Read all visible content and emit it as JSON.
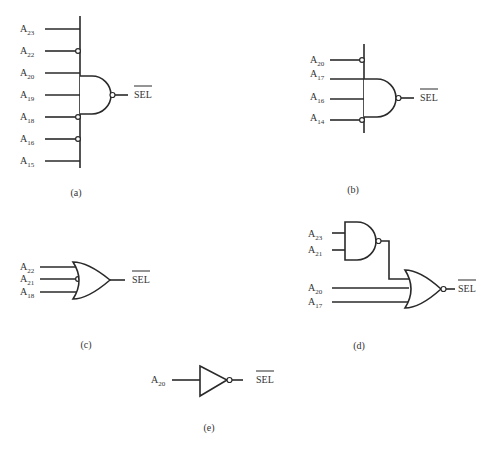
{
  "diagrams": {
    "a": {
      "caption": "(a)",
      "gate": "NAND",
      "inputs": [
        {
          "base": "A",
          "sub": "23",
          "inverted": false
        },
        {
          "base": "A",
          "sub": "22",
          "inverted": true
        },
        {
          "base": "A",
          "sub": "20",
          "inverted": false
        },
        {
          "base": "A",
          "sub": "19",
          "inverted": false
        },
        {
          "base": "A",
          "sub": "18",
          "inverted": true
        },
        {
          "base": "A",
          "sub": "16",
          "inverted": true
        },
        {
          "base": "A",
          "sub": "15",
          "inverted": false
        }
      ],
      "output": "SEL"
    },
    "b": {
      "caption": "(b)",
      "gate": "NAND",
      "inputs": [
        {
          "base": "A",
          "sub": "20",
          "inverted": true
        },
        {
          "base": "A",
          "sub": "17",
          "inverted": false
        },
        {
          "base": "A",
          "sub": "16",
          "inverted": false
        },
        {
          "base": "A",
          "sub": "14",
          "inverted": true
        }
      ],
      "output": "SEL"
    },
    "c": {
      "caption": "(c)",
      "gate": "OR",
      "inputs": [
        {
          "base": "A",
          "sub": "22",
          "inverted": false
        },
        {
          "base": "A",
          "sub": "21",
          "inverted": true
        },
        {
          "base": "A",
          "sub": "18",
          "inverted": false
        }
      ],
      "output": "SEL"
    },
    "d": {
      "caption": "(d)",
      "gate": "NAND into NOR",
      "and_inputs": [
        {
          "base": "A",
          "sub": "23"
        },
        {
          "base": "A",
          "sub": "21"
        }
      ],
      "or_inputs": [
        {
          "base": "A",
          "sub": "20"
        },
        {
          "base": "A",
          "sub": "17"
        }
      ],
      "output": "SEL"
    },
    "e": {
      "caption": "(e)",
      "gate": "NOT",
      "inputs": [
        {
          "base": "A",
          "sub": "20"
        }
      ],
      "output": "SEL"
    }
  }
}
